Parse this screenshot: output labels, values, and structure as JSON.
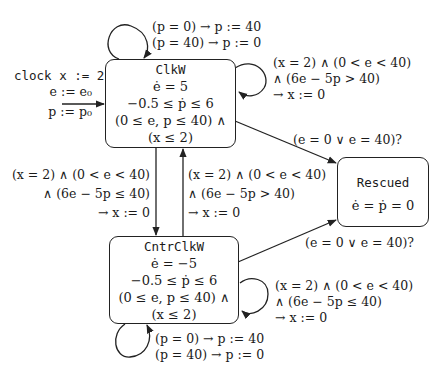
{
  "diagram": {
    "type": "hybrid-automaton",
    "initial": {
      "lines": [
        "clock x := 2",
        "e := e₀",
        "p := p₀"
      ]
    },
    "states": [
      {
        "id": "clkw",
        "name": "ClkW",
        "lines": [
          "ė = 5",
          "−0.5 ≤ ṗ ≤ 6",
          "(0 ≤ e, p ≤ 40) ∧",
          "(x ≤ 2)"
        ]
      },
      {
        "id": "cntrclkw",
        "name": "CntrClkW",
        "lines": [
          "ė = −5",
          "−0.5 ≤ ṗ ≤ 6",
          "(0 ≤ e, p ≤ 40) ∧",
          "(x ≤ 2)"
        ]
      },
      {
        "id": "rescued",
        "name": "Rescued",
        "lines": [
          "ė = ṗ = 0"
        ]
      }
    ],
    "transitions": [
      {
        "id": "clkw-self-p",
        "from": "ClkW",
        "to": "ClkW",
        "lines": [
          "(p = 0) → p := 40",
          "(p = 40) → p := 0"
        ]
      },
      {
        "id": "clkw-self-x",
        "from": "ClkW",
        "to": "ClkW",
        "lines": [
          "(x = 2) ∧ (0 < e < 40)",
          "∧ (6e − 5p > 40)",
          "→ x := 0"
        ]
      },
      {
        "id": "clkw-to-cntr",
        "from": "ClkW",
        "to": "CntrClkW",
        "lines": [
          "(x = 2) ∧ (0 < e < 40)",
          "∧ (6e − 5p ≤ 40)",
          "→ x := 0"
        ]
      },
      {
        "id": "cntr-to-clkw",
        "from": "CntrClkW",
        "to": "ClkW",
        "lines": [
          "(x = 2) ∧ (0 < e < 40)",
          "∧ (6e − 5p > 40)",
          "→ x := 0"
        ]
      },
      {
        "id": "clkw-to-rescued",
        "from": "ClkW",
        "to": "Rescued",
        "lines": [
          "(e = 0 ∨ e = 40)?"
        ]
      },
      {
        "id": "cntr-to-rescued",
        "from": "CntrClkW",
        "to": "Rescued",
        "lines": [
          "(e = 0 ∨ e = 40)?"
        ]
      },
      {
        "id": "cntr-self-x",
        "from": "CntrClkW",
        "to": "CntrClkW",
        "lines": [
          "(x = 2) ∧ (0 < e < 40)",
          "∧ (6e − 5p ≤ 40)",
          "→ x := 0"
        ]
      },
      {
        "id": "cntr-self-p",
        "from": "CntrClkW",
        "to": "CntrClkW",
        "lines": [
          "(p = 0) → p := 40",
          "(p = 40) → p := 0"
        ]
      }
    ]
  }
}
